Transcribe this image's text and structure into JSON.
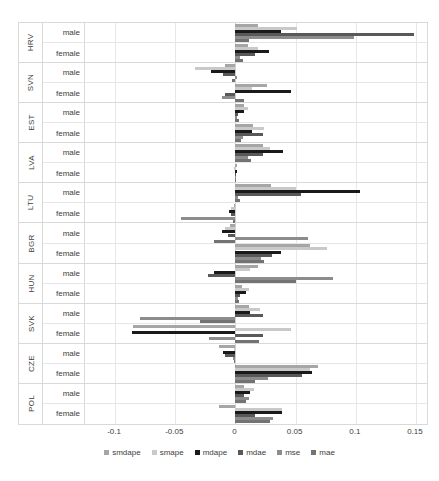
{
  "chart_data": {
    "type": "bar",
    "orientation": "horizontal",
    "title": "",
    "subtitle": "",
    "xlabel": "",
    "ylabel": "",
    "xlim": [
      -0.125,
      0.16
    ],
    "xticks": [
      -0.1,
      -0.05,
      0,
      0.05,
      0.1,
      0.15
    ],
    "xticklabels": [
      "-0.1",
      "-0.05",
      "0",
      "0.05",
      "0.1",
      "0.15"
    ],
    "grid": true,
    "legend_position": "bottom",
    "series_order": [
      "smdape",
      "smape",
      "mdape",
      "mdae",
      "mse",
      "mae"
    ],
    "series_colors": {
      "smdape": "#a6a6a6",
      "smape": "#c9c9c9",
      "mdape": "#1a1a1a",
      "mdae": "#595959",
      "mse": "#8c8c8c",
      "mae": "#737373"
    },
    "categories": [
      "HRV",
      "SVN",
      "EST",
      "LVA",
      "LTU",
      "BGR",
      "HUN",
      "SVK",
      "CZE",
      "POL"
    ],
    "subcategories": [
      "male",
      "female"
    ],
    "groups": [
      {
        "country": "HRV",
        "rows": [
          {
            "gender": "male",
            "values": {
              "smdape": 0.0185,
              "smape": 0.051,
              "mdape": 0.0375,
              "mdae": 0.148,
              "mse": 0.0985,
              "mae": 0.011
            }
          },
          {
            "gender": "female",
            "values": {
              "smdape": 0.0105,
              "smape": 0.0185,
              "mdape": 0.0275,
              "mdae": 0.0165,
              "mse": 0.004,
              "mae": 0.0065
            }
          }
        ]
      },
      {
        "country": "SVN",
        "rows": [
          {
            "gender": "male",
            "values": {
              "smdape": -0.009,
              "smape": -0.0335,
              "mdape": -0.02,
              "mdae": -0.0105,
              "mse": 0.001,
              "mae": -0.0025
            }
          },
          {
            "gender": "female",
            "values": {
              "smdape": 0.026,
              "smape": 0.0135,
              "mdape": 0.046,
              "mdae": -0.009,
              "mse": -0.011,
              "mae": 0.0075
            }
          }
        ]
      },
      {
        "country": "EST",
        "rows": [
          {
            "gender": "male",
            "values": {
              "smdape": 0.0075,
              "smape": 0.0105,
              "mdape": 0.0075,
              "mdae": 0.002,
              "mse": 0.0015,
              "mae": 0.003
            }
          },
          {
            "gender": "female",
            "values": {
              "smdape": 0.0145,
              "smape": 0.0235,
              "mdape": 0.0135,
              "mdae": 0.0225,
              "mse": 0.006,
              "mae": 0.0045
            }
          }
        ]
      },
      {
        "country": "LVA",
        "rows": [
          {
            "gender": "male",
            "values": {
              "smdape": 0.0225,
              "smape": 0.0285,
              "mdape": 0.0395,
              "mdae": 0.023,
              "mse": 0.0105,
              "mae": 0.013
            }
          },
          {
            "gender": "female",
            "values": {
              "smdape": 0.0015,
              "smape": -0.0015,
              "mdape": 0.001,
              "mdae": 0.0005,
              "mse": 0.0005,
              "mae": 0.0008
            }
          }
        ]
      },
      {
        "country": "LTU",
        "rows": [
          {
            "gender": "male",
            "values": {
              "smdape": 0.0295,
              "smape": 0.05,
              "mdape": 0.1035,
              "mdae": 0.0545,
              "mse": 0.002,
              "mae": 0.0035
            }
          },
          {
            "gender": "female",
            "values": {
              "smdape": -0.0015,
              "smape": -0.0035,
              "mdape": -0.0055,
              "mdae": -0.0035,
              "mse": -0.045,
              "mae": -0.002
            }
          }
        ]
      },
      {
        "country": "BGR",
        "rows": [
          {
            "gender": "male",
            "values": {
              "smdape": -0.0045,
              "smape": -0.0085,
              "mdape": -0.0115,
              "mdae": -0.0065,
              "mse": 0.06,
              "mae": -0.0175
            }
          },
          {
            "gender": "female",
            "values": {
              "smdape": 0.062,
              "smape": 0.076,
              "mdape": 0.0375,
              "mdae": 0.03,
              "mse": 0.0215,
              "mae": 0.024
            }
          }
        ]
      },
      {
        "country": "HUN",
        "rows": [
          {
            "gender": "male",
            "values": {
              "smdape": 0.0185,
              "smape": 0.012,
              "mdape": -0.0175,
              "mdae": -0.0225,
              "mse": 0.081,
              "mae": 0.05
            }
          },
          {
            "gender": "female",
            "values": {
              "smdape": 0.0055,
              "smape": 0.0115,
              "mdape": 0.009,
              "mdae": 0.004,
              "mse": 0.002,
              "mae": 0.003
            }
          }
        ]
      },
      {
        "country": "SVK",
        "rows": [
          {
            "gender": "male",
            "values": {
              "smdape": 0.011,
              "smape": 0.02,
              "mdape": 0.0125,
              "mdae": 0.023,
              "mse": -0.079,
              "mae": -0.0295
            }
          },
          {
            "gender": "female",
            "values": {
              "smdape": -0.0855,
              "smape": 0.046,
              "mdape": -0.086,
              "mdae": 0.023,
              "mse": -0.022,
              "mae": 0.0195
            }
          }
        ]
      },
      {
        "country": "CZE",
        "rows": [
          {
            "gender": "male",
            "values": {
              "smdape": -0.0135,
              "smape": -0.001,
              "mdape": -0.0105,
              "mdae": -0.009,
              "mse": -0.002,
              "mae": -0.0015
            }
          },
          {
            "gender": "female",
            "values": {
              "smdape": 0.0685,
              "smape": 0.062,
              "mdape": 0.0635,
              "mdae": 0.0555,
              "mse": 0.027,
              "mae": 0.016
            }
          }
        ]
      },
      {
        "country": "POL",
        "rows": [
          {
            "gender": "male",
            "values": {
              "smdape": 0.0075,
              "smape": 0.0155,
              "mdape": 0.0125,
              "mdae": 0.0075,
              "mse": 0.0115,
              "mae": 0.009
            }
          },
          {
            "gender": "female",
            "values": {
              "smdape": -0.0135,
              "smape": 0.0385,
              "mdape": 0.039,
              "mdae": 0.0165,
              "mse": 0.031,
              "mae": 0.029
            }
          }
        ]
      }
    ]
  },
  "legend": {
    "items": [
      {
        "label": "smdape",
        "color": "#a6a6a6"
      },
      {
        "label": "smape",
        "color": "#c9c9c9"
      },
      {
        "label": "mdape",
        "color": "#1a1a1a"
      },
      {
        "label": "mdae",
        "color": "#595959"
      },
      {
        "label": "mse",
        "color": "#8c8c8c"
      },
      {
        "label": "mae",
        "color": "#737373"
      }
    ]
  }
}
